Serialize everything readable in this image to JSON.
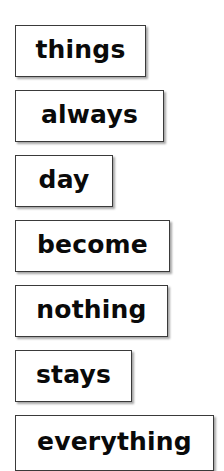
{
  "word_cards": [
    {
      "label": "things"
    },
    {
      "label": "always"
    },
    {
      "label": "day"
    },
    {
      "label": "become"
    },
    {
      "label": "nothing"
    },
    {
      "label": "stays"
    },
    {
      "label": "everything"
    }
  ],
  "colors": {
    "background": "#ffffff",
    "card_border": "#3a3a3a",
    "text": "#0a0a0a"
  }
}
